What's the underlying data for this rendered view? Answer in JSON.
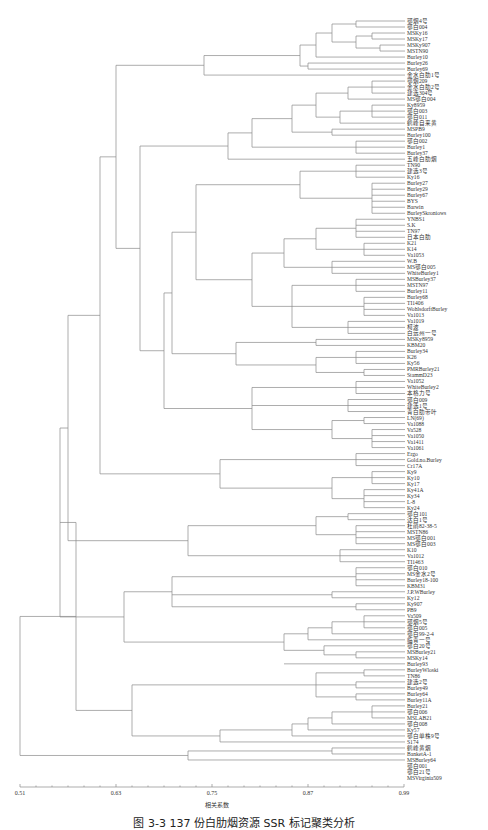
{
  "chart_data": {
    "type": "dendrogram",
    "title": "",
    "xlabel": "相关系数",
    "ylabel": "",
    "xlim": [
      0.51,
      0.99
    ],
    "x_ticks": [
      "0.51",
      "0.63",
      "0.75",
      "0.87",
      "0.99"
    ],
    "grid": false,
    "legend": null,
    "caption": "图 3-3  137 份白肋烟资源 SSR 标记聚类分析",
    "leaves": [
      "鄂烟4号",
      "鄂白004",
      "MSKy16",
      "MSKy17",
      "MSKy907",
      "MSTN90",
      "Burley10",
      "Burley26",
      "Burley69",
      "金水白肋1号",
      "鄂烟209",
      "金水白肋2号",
      "建选304号",
      "MS鄂白004",
      "Ky8959",
      "鄂白003",
      "鄂白011",
      "鹤峰自来黄",
      "MSPB9",
      "Burley100",
      "鄂白002",
      "Burley1",
      "Burley37",
      "五峰白肋烟",
      "TN90",
      "建选3号",
      "Ky16",
      "Burley27",
      "Burley29",
      "Burley67",
      "BYS",
      "Barwin",
      "BurleySkroniows",
      "YNBS1",
      "S.K",
      "TN97",
      "日本白肋",
      "K21",
      "K14",
      "Va1053",
      "W.B",
      "MS鄂白005",
      "WhiteBurley1",
      "MSBurley37",
      "MSTN97",
      "Burley11",
      "Burley68",
      "TI1406",
      "WohlsdorftBurley",
      "Va1013",
      "Va1019",
      "柯波",
      "白远州一号",
      "MSKy8959",
      "KBM20",
      "Burley34",
      "K26",
      "Ky56",
      "PMRBurley21",
      "StammD23",
      "Va1052",
      "WhiteBurley2",
      "本格力号",
      "鄂白009",
      "建选1号",
      "青白肋带叶",
      "LN(69)",
      "Va1088",
      "Va528",
      "Va1050",
      "Va1411",
      "Va1061",
      "Ergo",
      "Gold.no.Burley",
      "Cr17A",
      "Ky9",
      "Ky10",
      "Ky17",
      "Ky41A",
      "Ky34",
      "L-8",
      "Ky24",
      "鄂白101",
      "达白1号",
      "杜鹃82-38-5",
      "MSTN86",
      "MS鄂白001",
      "MS鄂白003",
      "K10",
      "Va1012",
      "TI1463",
      "鄂白010",
      "MS金水2号",
      "Burley18-100",
      "KBM31",
      "J.P.WBurley",
      "Ky12",
      "Ky907",
      "PB9",
      "Va509",
      "鄂烟5号",
      "鄂白005",
      "鄂白99-2-4",
      "临青一号",
      "鄂白20号",
      "MSBurley21",
      "MSKy14",
      "Burley93",
      "BurleyWloski",
      "TN86",
      "建选2号",
      "Burley49",
      "Burley64",
      "Burley11A",
      "Burley21",
      "鄂白006",
      "MSLAB21",
      "鄂白008",
      "Ky57",
      "鄂白单株9号",
      "S174",
      "鹤峰黄烟",
      "BanketA-1",
      "MSBurley64",
      "鄂白001",
      "鄂白21号",
      "MSVirginia509"
    ],
    "major_merges": [
      {
        "clusters": "all",
        "similarity": 0.51
      },
      {
        "clusters": "top-block vs bottom-block",
        "similarity": 0.56
      },
      {
        "clusters": "MSVirginia509 group",
        "similarity": 0.71
      },
      {
        "clusters": "Burley/TN86 block",
        "similarity": 0.6
      },
      {
        "clusters": "鄂白101 … Va509 block",
        "similarity": 0.66
      }
    ]
  }
}
